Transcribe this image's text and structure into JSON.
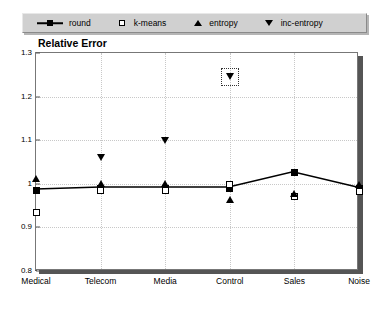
{
  "legend": {
    "entries": [
      {
        "label": "round",
        "marker": "line-square-filled-icon"
      },
      {
        "label": "k-means",
        "marker": "square-open-icon"
      },
      {
        "label": "entropy",
        "marker": "triangle-up-icon"
      },
      {
        "label": "inc-entropy",
        "marker": "triangle-down-icon"
      }
    ],
    "background_color": "#d0d0d0"
  },
  "chart_data": {
    "type": "scatter",
    "title": "Relative Error",
    "xlabel": "",
    "ylabel": "",
    "categories": [
      "Medical",
      "Telecom",
      "Media",
      "Control",
      "Sales",
      "Noise"
    ],
    "ylim": [
      0.8,
      1.3
    ],
    "yticks": [
      "0.8",
      "0.9",
      "1",
      "1.1",
      "1.2",
      "1.3"
    ],
    "ytick_values": [
      0.8,
      0.9,
      1.0,
      1.1,
      1.2,
      1.3
    ],
    "grid": true,
    "legend_position": "top",
    "series": [
      {
        "name": "round",
        "marker": "square-filled",
        "line": true,
        "values": [
          0.985,
          0.99,
          0.99,
          0.99,
          1.025,
          0.99
        ]
      },
      {
        "name": "k-means",
        "marker": "square-open",
        "line": false,
        "values": [
          0.935,
          0.985,
          0.985,
          0.998,
          0.972,
          0.982
        ]
      },
      {
        "name": "entropy",
        "marker": "triangle-up",
        "line": false,
        "values": [
          1.012,
          1.0,
          1.0,
          0.965,
          0.978,
          0.998
        ]
      },
      {
        "name": "inc-entropy",
        "marker": "triangle-down",
        "line": false,
        "values": [
          null,
          1.06,
          1.1,
          1.245,
          null,
          null
        ]
      }
    ],
    "annotations": [
      {
        "type": "selection-box",
        "series": "inc-entropy",
        "category": "Control",
        "value": 1.245
      }
    ]
  }
}
